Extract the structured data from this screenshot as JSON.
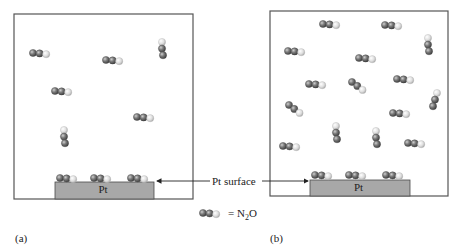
{
  "colors": {
    "box_border": "#555555",
    "pt_fill": "#a8a8a8",
    "pt_border": "#4a4a4a",
    "n_atom": "#6e6e6e",
    "o_atom": "#d8d8d8",
    "arrow": "#222222"
  },
  "labels": {
    "pt_surface": "Pt surface",
    "pt_block": "Pt",
    "legend_eq": "= N",
    "legend_sub": "2",
    "legend_tail": "O",
    "panel_a": "(a)",
    "panel_b": "(b)"
  },
  "panels": [
    {
      "id": "a",
      "box": {
        "x": 14,
        "y": 14,
        "w": 179,
        "h": 185
      },
      "pt": {
        "x": 55,
        "y": 182,
        "w": 99,
        "h": 17
      },
      "surface_molecules": [
        {
          "x": 60,
          "y": 178,
          "orient": "h"
        },
        {
          "x": 94,
          "y": 178,
          "orient": "h"
        },
        {
          "x": 131,
          "y": 178,
          "orient": "h"
        }
      ],
      "gas_molecules": [
        {
          "x": 33,
          "y": 53,
          "orient": "h"
        },
        {
          "x": 106,
          "y": 60,
          "orient": "h"
        },
        {
          "x": 162,
          "y": 42,
          "orient": "vd"
        },
        {
          "x": 55,
          "y": 91,
          "orient": "h"
        },
        {
          "x": 137,
          "y": 117,
          "orient": "h"
        },
        {
          "x": 64,
          "y": 130,
          "orient": "vd"
        }
      ]
    },
    {
      "id": "b",
      "box": {
        "x": 270,
        "y": 11,
        "w": 178,
        "h": 185
      },
      "pt": {
        "x": 310,
        "y": 180,
        "w": 100,
        "h": 16
      },
      "surface_molecules": [
        {
          "x": 315,
          "y": 175,
          "orient": "h"
        },
        {
          "x": 349,
          "y": 175,
          "orient": "h"
        },
        {
          "x": 386,
          "y": 175,
          "orient": "h"
        }
      ],
      "gas_molecules": [
        {
          "x": 323,
          "y": 24,
          "orient": "h"
        },
        {
          "x": 385,
          "y": 25,
          "orient": "h"
        },
        {
          "x": 428,
          "y": 38,
          "orient": "vd"
        },
        {
          "x": 288,
          "y": 51,
          "orient": "h"
        },
        {
          "x": 359,
          "y": 58,
          "orient": "h"
        },
        {
          "x": 309,
          "y": 84,
          "orient": "h"
        },
        {
          "x": 352,
          "y": 82,
          "orient": "dd"
        },
        {
          "x": 397,
          "y": 79,
          "orient": "h"
        },
        {
          "x": 437,
          "y": 93,
          "orient": "vu"
        },
        {
          "x": 289,
          "y": 105,
          "orient": "dd"
        },
        {
          "x": 393,
          "y": 113,
          "orient": "h"
        },
        {
          "x": 336,
          "y": 126,
          "orient": "vd"
        },
        {
          "x": 376,
          "y": 131,
          "orient": "vd"
        },
        {
          "x": 283,
          "y": 146,
          "orient": "h"
        },
        {
          "x": 408,
          "y": 143,
          "orient": "h"
        }
      ]
    }
  ],
  "pointer": {
    "label_x": 212,
    "label_y": 176,
    "left_arrow": {
      "x1": 210,
      "y1": 181,
      "x2": 157,
      "y2": 181
    },
    "right_arrow": {
      "x1": 262,
      "y1": 181,
      "x2": 308,
      "y2": 181
    }
  },
  "legend": {
    "x": 203,
    "y": 213
  }
}
